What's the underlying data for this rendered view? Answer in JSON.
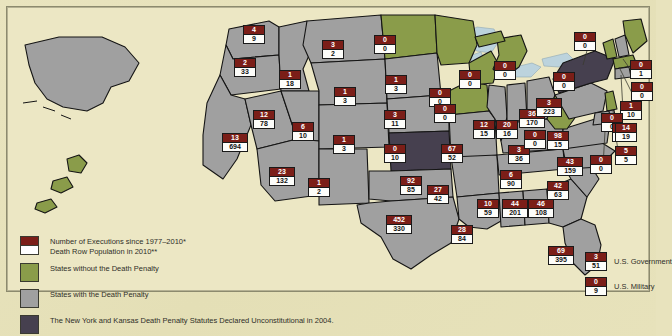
{
  "map": {
    "title": "Death Penalty in the United States",
    "background_color": "#e8e3bd",
    "colors": {
      "executions_box": "#7b1e18",
      "deathrow_box": "#ffffff",
      "state_no_penalty": "#8a9c4a",
      "state_with_penalty": "#a0a0a0",
      "state_unconstitutional": "#46404f",
      "water": "#bcd3dd",
      "land_outside": "#ddd7ab"
    }
  },
  "legend": {
    "items": [
      {
        "swatch": "split-maroon-white",
        "lines": [
          "Number of Executions since 1977–2010*",
          "Death Row Population in 2010**"
        ]
      },
      {
        "swatch": "green",
        "lines": [
          "States without the Death Penalty"
        ]
      },
      {
        "swatch": "gray",
        "lines": [
          "States with the Death Penalty"
        ]
      },
      {
        "swatch": "purple",
        "lines": [
          "The New York and Kansas Death Penalty Statutes Declared Unconstitutional in 2004."
        ]
      }
    ]
  },
  "side_entries": [
    {
      "label": "U.S. Government",
      "executions": "3",
      "death_row": "51"
    },
    {
      "label": "U.S. Military",
      "executions": "0",
      "death_row": "9"
    }
  ],
  "chart_data": {
    "type": "map",
    "value_labels": [
      "executions",
      "death_row"
    ],
    "categories_legend": [
      "States without the Death Penalty",
      "States with the Death Penalty",
      "Declared Unconstitutional in 2004"
    ],
    "states": [
      {
        "code": "WA",
        "name": "Washington",
        "status": "with",
        "executions": "4",
        "death_row": "9",
        "x": 243,
        "y": 25
      },
      {
        "code": "OR",
        "name": "Oregon",
        "status": "with",
        "executions": "2",
        "death_row": "33",
        "x": 234,
        "y": 58
      },
      {
        "code": "CA",
        "name": "California",
        "status": "with",
        "executions": "13",
        "death_row": "694",
        "x": 222,
        "y": 133
      },
      {
        "code": "ID",
        "name": "Idaho",
        "status": "with",
        "executions": "1",
        "death_row": "18",
        "x": 279,
        "y": 70
      },
      {
        "code": "NV",
        "name": "Nevada",
        "status": "with",
        "executions": "12",
        "death_row": "78",
        "x": 253,
        "y": 110
      },
      {
        "code": "UT",
        "name": "Utah",
        "status": "with",
        "executions": "6",
        "death_row": "10",
        "x": 292,
        "y": 122
      },
      {
        "code": "AZ",
        "name": "Arizona",
        "status": "with",
        "executions": "23",
        "death_row": "132",
        "x": 269,
        "y": 167
      },
      {
        "code": "MT",
        "name": "Montana",
        "status": "with",
        "executions": "3",
        "death_row": "2",
        "x": 322,
        "y": 40
      },
      {
        "code": "WY",
        "name": "Wyoming",
        "status": "with",
        "executions": "1",
        "death_row": "3",
        "x": 334,
        "y": 87
      },
      {
        "code": "CO",
        "name": "Colorado",
        "status": "with",
        "executions": "1",
        "death_row": "3",
        "x": 333,
        "y": 135
      },
      {
        "code": "NM",
        "name": "New Mexico",
        "status": "with",
        "executions": "1",
        "death_row": "2",
        "x": 308,
        "y": 178
      },
      {
        "code": "ND",
        "name": "North Dakota",
        "status": "without",
        "executions": "0",
        "death_row": "0",
        "x": 374,
        "y": 35
      },
      {
        "code": "SD",
        "name": "South Dakota",
        "status": "with",
        "executions": "1",
        "death_row": "3",
        "x": 385,
        "y": 75
      },
      {
        "code": "NE",
        "name": "Nebraska",
        "status": "with",
        "executions": "3",
        "death_row": "11",
        "x": 384,
        "y": 110
      },
      {
        "code": "KS",
        "name": "Kansas",
        "status": "unconstitutional",
        "executions": "0",
        "death_row": "10",
        "x": 384,
        "y": 144
      },
      {
        "code": "OK",
        "name": "Oklahoma",
        "status": "with",
        "executions": "92",
        "death_row": "85",
        "x": 400,
        "y": 176
      },
      {
        "code": "TX",
        "name": "Texas",
        "status": "with",
        "executions": "452",
        "death_row": "330",
        "x": 386,
        "y": 215
      },
      {
        "code": "MN",
        "name": "Minnesota",
        "status": "without",
        "executions": "0",
        "death_row": "0",
        "x": 429,
        "y": 88
      },
      {
        "code": "IA",
        "name": "Iowa",
        "status": "without",
        "executions": "0",
        "death_row": "0",
        "x": 434,
        "y": 104
      },
      {
        "code": "WI",
        "name": "Wisconsin",
        "status": "without",
        "executions": "0",
        "death_row": "0",
        "x": 459,
        "y": 70
      },
      {
        "code": "MO",
        "name": "Missouri",
        "status": "with",
        "executions": "67",
        "death_row": "52",
        "x": 441,
        "y": 144
      },
      {
        "code": "AR",
        "name": "Arkansas",
        "status": "with",
        "executions": "27",
        "death_row": "42",
        "x": 427,
        "y": 185
      },
      {
        "code": "LA",
        "name": "Louisiana",
        "status": "with",
        "executions": "28",
        "death_row": "84",
        "x": 451,
        "y": 225
      },
      {
        "code": "IL",
        "name": "Illinois",
        "status": "with",
        "executions": "12",
        "death_row": "15",
        "x": 473,
        "y": 120
      },
      {
        "code": "IN",
        "name": "Indiana",
        "status": "with",
        "executions": "20",
        "death_row": "16",
        "x": 496,
        "y": 120
      },
      {
        "code": "OH",
        "name": "Ohio",
        "status": "with",
        "executions": "36",
        "death_row": "170",
        "x": 519,
        "y": 109
      },
      {
        "code": "MI",
        "name": "Michigan",
        "status": "without",
        "executions": "0",
        "death_row": "0",
        "x": 494,
        "y": 61
      },
      {
        "code": "KY",
        "name": "Kentucky",
        "status": "with",
        "executions": "3",
        "death_row": "36",
        "x": 508,
        "y": 145
      },
      {
        "code": "TN",
        "name": "Tennessee",
        "status": "with",
        "executions": "6",
        "death_row": "90",
        "x": 500,
        "y": 170
      },
      {
        "code": "MS",
        "name": "Mississippi",
        "status": "with",
        "executions": "10",
        "death_row": "59",
        "x": 477,
        "y": 199
      },
      {
        "code": "AL",
        "name": "Alabama",
        "status": "with",
        "executions": "44",
        "death_row": "201",
        "x": 502,
        "y": 199
      },
      {
        "code": "GA",
        "name": "Georgia",
        "status": "with",
        "executions": "46",
        "death_row": "108",
        "x": 528,
        "y": 199
      },
      {
        "code": "FL",
        "name": "Florida",
        "status": "with",
        "executions": "69",
        "death_row": "395",
        "x": 548,
        "y": 246
      },
      {
        "code": "SC",
        "name": "South Carolina",
        "status": "with",
        "executions": "42",
        "death_row": "63",
        "x": 547,
        "y": 181
      },
      {
        "code": "NC",
        "name": "North Carolina",
        "status": "with",
        "executions": "43",
        "death_row": "159",
        "x": 557,
        "y": 157
      },
      {
        "code": "VA",
        "name": "Virginia",
        "status": "with",
        "executions": "98",
        "death_row": "15",
        "x": 547,
        "y": 131
      },
      {
        "code": "WV",
        "name": "West Virginia",
        "status": "without",
        "executions": "0",
        "death_row": "0",
        "x": 524,
        "y": 130
      },
      {
        "code": "PA",
        "name": "Pennsylvania",
        "status": "with",
        "executions": "3",
        "death_row": "223",
        "x": 536,
        "y": 98
      },
      {
        "code": "NY",
        "name": "New York",
        "status": "unconstitutional",
        "executions": "0",
        "death_row": "0",
        "x": 553,
        "y": 72
      },
      {
        "code": "VT",
        "name": "Vermont",
        "status": "without",
        "executions": "0",
        "death_row": "0",
        "x": 574,
        "y": 32
      },
      {
        "code": "NH",
        "name": "New Hampshire",
        "status": "with",
        "executions": "0",
        "death_row": "1",
        "x": 630,
        "y": 60
      },
      {
        "code": "MA",
        "name": "Massachusetts",
        "status": "without",
        "executions": "0",
        "death_row": "0",
        "x": 631,
        "y": 82
      },
      {
        "code": "CT",
        "name": "Connecticut",
        "status": "with",
        "executions": "1",
        "death_row": "10",
        "x": 620,
        "y": 101
      },
      {
        "code": "RI",
        "name": "Rhode Island",
        "status": "without",
        "executions": "0",
        "death_row": "0",
        "x": 601,
        "y": 113
      },
      {
        "code": "NJ",
        "name": "New Jersey",
        "status": "without",
        "executions": "0",
        "death_row": "0",
        "x": 612,
        "y": 123
      },
      {
        "code": "DE",
        "name": "Delaware",
        "status": "with",
        "executions": "5",
        "death_row": "5",
        "x": 615,
        "y": 146
      },
      {
        "code": "MD",
        "name": "Maryland",
        "status": "with",
        "executions": "14",
        "death_row": "19",
        "x": 615,
        "y": 123
      },
      {
        "code": "DC",
        "name": "District of Columbia",
        "status": "without",
        "executions": "0",
        "death_row": "0",
        "x": 590,
        "y": 155
      }
    ]
  }
}
